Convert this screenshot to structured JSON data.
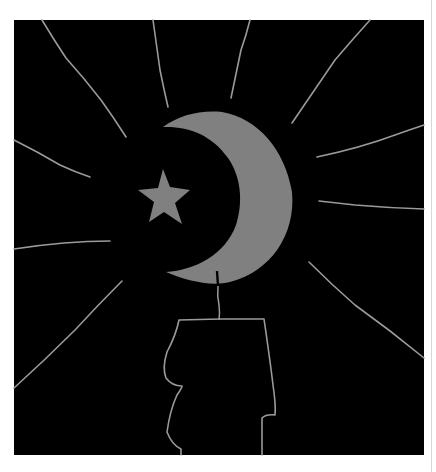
{
  "artwork": {
    "title": "Crescent moon, star and candle",
    "colors": {
      "page_background": "#ffffff",
      "panel_background": "#000000",
      "moon_fill": "#808080",
      "star_fill": "#808080",
      "line_color": "#9a9a9a",
      "wick_cut": "#000000",
      "edge_line": "#d6d6d6"
    },
    "elements": [
      "black-panel",
      "light-rays",
      "crescent-moon",
      "star",
      "candle-wick",
      "candle-outline"
    ]
  }
}
